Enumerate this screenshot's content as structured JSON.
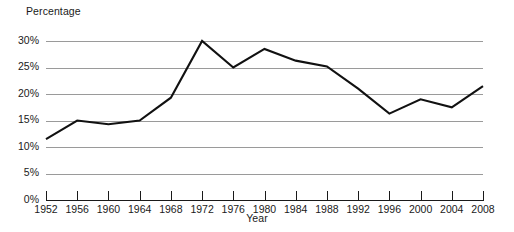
{
  "chart_data": {
    "type": "line",
    "title": "",
    "xlabel": "Year",
    "ylabel": "Percentage",
    "x": [
      1952,
      1956,
      1960,
      1964,
      1968,
      1972,
      1976,
      1980,
      1984,
      1988,
      1992,
      1996,
      2000,
      2004,
      2008
    ],
    "categories": [
      "1952",
      "1956",
      "1960",
      "1964",
      "1968",
      "1972",
      "1976",
      "1980",
      "1984",
      "1988",
      "1992",
      "1996",
      "2000",
      "2004",
      "2008"
    ],
    "values": [
      11.5,
      15.0,
      14.3,
      15.0,
      19.3,
      30.0,
      25.0,
      28.5,
      26.3,
      25.2,
      21.0,
      16.3,
      19.0,
      17.5,
      21.5
    ],
    "series": [
      {
        "name": "Percentage",
        "values": [
          11.5,
          15.0,
          14.3,
          15.0,
          19.3,
          30.0,
          25.0,
          28.5,
          26.3,
          25.2,
          21.0,
          16.3,
          19.0,
          17.5,
          21.5
        ]
      }
    ],
    "ylim": [
      0,
      30
    ],
    "xlim": [
      1952,
      2008
    ],
    "ytick_labels": [
      "0%",
      "5%",
      "10%",
      "15%",
      "20%",
      "25%",
      "30%"
    ],
    "ytick_values": [
      0,
      5,
      10,
      15,
      20,
      25,
      30
    ],
    "grid": true,
    "legend": false,
    "legend_position": "none",
    "line_color": "#111111",
    "grid_color": "#9a9a9a",
    "axis_color": "#1a1a1a",
    "background_color": "#ffffff"
  }
}
